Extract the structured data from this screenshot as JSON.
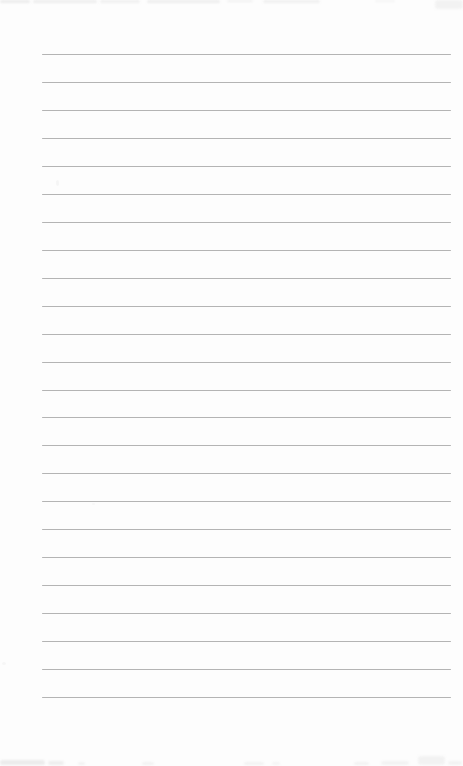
{
  "page": {
    "background_color": "#fdfdfd",
    "width": 463,
    "height": 766
  },
  "ruling": {
    "line_count": 24,
    "first_line_y": 54,
    "line_spacing": 27.96,
    "line_start_x": 42,
    "line_end_x": 451,
    "line_color": "#b4b4b4",
    "line_thickness": 1
  },
  "artifacts": {
    "smudge_color": "#e8e8e8",
    "top_edge": [
      {
        "x": 0,
        "y": 0,
        "w": 30,
        "h": 3,
        "o": 0.8
      },
      {
        "x": 33,
        "y": 0,
        "w": 64,
        "h": 3,
        "o": 0.7
      },
      {
        "x": 100,
        "y": 0,
        "w": 40,
        "h": 3,
        "o": 0.6
      },
      {
        "x": 147,
        "y": 0,
        "w": 73,
        "h": 3,
        "o": 0.7
      },
      {
        "x": 227,
        "y": 0,
        "w": 26,
        "h": 2,
        "o": 0.6
      },
      {
        "x": 263,
        "y": 0,
        "w": 57,
        "h": 3,
        "o": 0.6
      },
      {
        "x": 375,
        "y": 0,
        "w": 20,
        "h": 2,
        "o": 0.4
      },
      {
        "x": 435,
        "y": 0,
        "w": 28,
        "h": 9,
        "o": 0.5
      }
    ],
    "bottom_edge": [
      {
        "x": 0,
        "y": 760,
        "w": 45,
        "h": 5,
        "o": 0.8
      },
      {
        "x": 48,
        "y": 761,
        "w": 16,
        "h": 4,
        "o": 0.7
      },
      {
        "x": 78,
        "y": 762,
        "w": 7,
        "h": 3,
        "o": 0.5
      },
      {
        "x": 142,
        "y": 762,
        "w": 12,
        "h": 3,
        "o": 0.5
      },
      {
        "x": 244,
        "y": 762,
        "w": 20,
        "h": 3,
        "o": 0.5
      },
      {
        "x": 272,
        "y": 762,
        "w": 8,
        "h": 3,
        "o": 0.4
      },
      {
        "x": 354,
        "y": 762,
        "w": 15,
        "h": 3,
        "o": 0.5
      },
      {
        "x": 381,
        "y": 761,
        "w": 28,
        "h": 4,
        "o": 0.5
      },
      {
        "x": 418,
        "y": 756,
        "w": 27,
        "h": 9,
        "o": 0.5
      },
      {
        "x": 448,
        "y": 761,
        "w": 14,
        "h": 4,
        "o": 0.5
      }
    ],
    "specks": [
      {
        "x": 56,
        "y": 180,
        "w": 3,
        "h": 6,
        "o": 0.35
      },
      {
        "x": 2,
        "y": 662,
        "w": 4,
        "h": 3,
        "o": 0.3
      },
      {
        "x": 92,
        "y": 503,
        "w": 3,
        "h": 2,
        "o": 0.25
      }
    ]
  }
}
